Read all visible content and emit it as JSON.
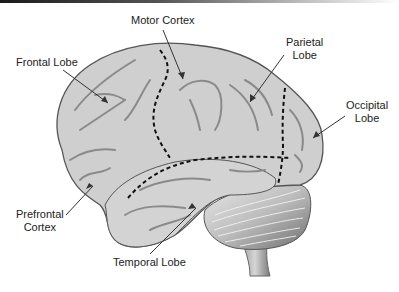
{
  "diagram": {
    "labels": {
      "motor_cortex": "Motor Cortex",
      "frontal_lobe": "Frontal Lobe",
      "parietal_lobe": "Parietal\nLobe",
      "occipital_lobe": "Occipital\nLobe",
      "prefrontal_cortex": "Prefrontal\nCortex",
      "temporal_lobe": "Temporal Lobe"
    },
    "colors": {
      "cortex_fill": "#cfcfcf",
      "cortex_outline": "#555555",
      "sulci": "#888888",
      "divider": "#111111",
      "cerebellum": "#9a9a9a"
    }
  }
}
